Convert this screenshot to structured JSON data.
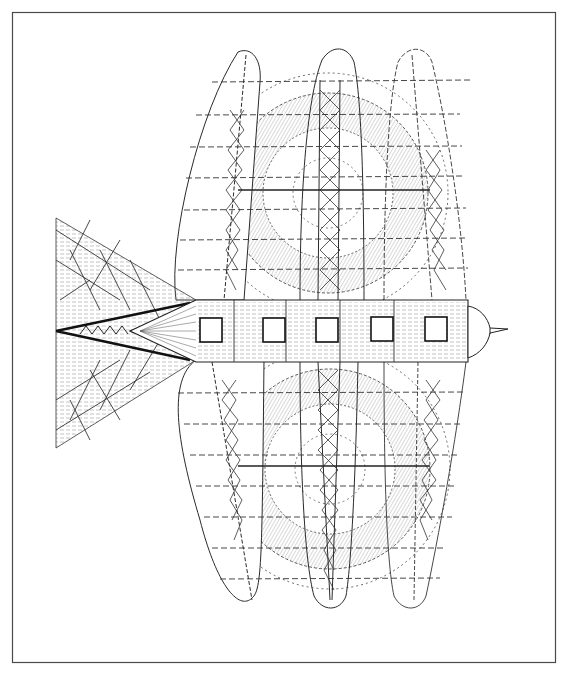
{
  "figure": {
    "colors": {
      "ink": "#2a2a2a",
      "light_ink": "#777777",
      "frame": "#4a4a4a",
      "background": "#ffffff"
    },
    "components": {
      "fuselage": {
        "windows": 5
      },
      "wings": {
        "count": 3
      },
      "rotors": {
        "count": 2
      },
      "tail": "triangular lattice tail",
      "nose": "pointed cone"
    }
  }
}
